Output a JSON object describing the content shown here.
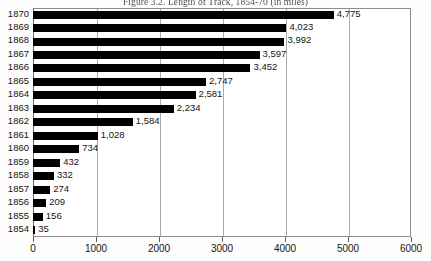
{
  "figure": {
    "title": "Figure 3.2. Length of Track, 1854-70 (in miles)"
  },
  "chart_data": {
    "type": "bar",
    "orientation": "horizontal",
    "title": "Figure 3.2. Length of Track, 1854-70 (in miles)",
    "xlabel": "",
    "ylabel": "",
    "categories": [
      "1870",
      "1869",
      "1868",
      "1867",
      "1866",
      "1865",
      "1864",
      "1863",
      "1862",
      "1861",
      "1860",
      "1859",
      "1858",
      "1857",
      "1856",
      "1855",
      "1854"
    ],
    "values": [
      4775,
      4023,
      3992,
      3597,
      3452,
      2747,
      2581,
      2234,
      1584,
      1028,
      734,
      432,
      332,
      274,
      209,
      156,
      35
    ],
    "data_labels": [
      "4,775",
      "4,023",
      "3,992",
      "3,597",
      "3,452",
      "2,747",
      "2,581",
      "2,234",
      "1,584",
      "1,028",
      "734",
      "432",
      "332",
      "274",
      "209",
      "156",
      "35"
    ],
    "xlim": [
      0,
      6000
    ],
    "xticks": [
      0,
      1000,
      2000,
      3000,
      4000,
      5000,
      6000
    ],
    "xtick_labels": [
      "0",
      "1000",
      "2000",
      "3000",
      "4000",
      "5000",
      "6000"
    ],
    "grid": true,
    "grid_axis": "x",
    "legend": false,
    "bar_color": "#000000",
    "plot_background": "#ffffff",
    "frame_color": "#8d8d8d",
    "gridline_color": "#a9a9a9"
  }
}
